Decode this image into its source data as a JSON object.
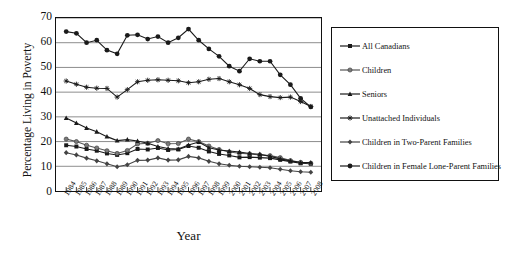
{
  "chart_data": {
    "type": "line",
    "title": "",
    "xlabel": "Year",
    "ylabel": "Percentage Living in Poverty",
    "ylim": [
      0,
      70
    ],
    "yticks": [
      0,
      10,
      20,
      30,
      40,
      50,
      60,
      70
    ],
    "grid": true,
    "legend_position": "right",
    "categories": [
      "1984",
      "1985",
      "1986",
      "1987",
      "1988",
      "1989",
      "1990",
      "1991",
      "1992",
      "1993",
      "1994",
      "1995",
      "1996",
      "1997",
      "1998",
      "1999",
      "2000",
      "2001",
      "2002",
      "2003",
      "2004",
      "2005",
      "2006",
      "2007",
      "2008"
    ],
    "series": [
      {
        "name": "All Canadians",
        "marker": "square",
        "color": "#1a1a1a",
        "values": [
          18.5,
          18.0,
          17.0,
          16.3,
          15.2,
          14.6,
          15.3,
          17.0,
          16.8,
          17.4,
          16.6,
          16.8,
          18.2,
          17.5,
          16.0,
          15.0,
          14.4,
          13.6,
          13.7,
          13.5,
          13.3,
          12.6,
          11.9,
          11.2,
          11.0
        ]
      },
      {
        "name": "Children",
        "marker": "circle-grey",
        "color": "#555555",
        "values": [
          21.0,
          20.0,
          18.5,
          17.4,
          16.3,
          15.2,
          16.4,
          19.0,
          19.3,
          20.4,
          19.1,
          19.2,
          21.0,
          20.0,
          18.2,
          16.8,
          15.8,
          15.3,
          15.0,
          14.6,
          14.3,
          13.5,
          12.3,
          11.6,
          11.2
        ]
      },
      {
        "name": "Seniors",
        "marker": "triangle",
        "color": "#1a1a1a",
        "values": [
          29.5,
          27.5,
          25.5,
          24.0,
          22.0,
          20.4,
          20.8,
          20.2,
          19.3,
          18.0,
          17.2,
          17.0,
          18.6,
          19.8,
          17.5,
          16.6,
          16.2,
          15.8,
          15.2,
          14.9,
          14.0,
          13.0,
          12.2,
          11.5,
          11.5
        ]
      },
      {
        "name": "Unattached Individuals",
        "marker": "asterisk",
        "color": "#1a1a1a",
        "values": [
          44.5,
          43.2,
          42.0,
          41.6,
          41.5,
          38.0,
          41.0,
          44.2,
          44.8,
          45.0,
          44.8,
          44.6,
          43.8,
          44.2,
          45.2,
          45.5,
          44.2,
          43.0,
          41.5,
          39.0,
          38.2,
          37.8,
          38.0,
          36.2,
          34.2
        ]
      },
      {
        "name": "Children in Two-Parent Families",
        "marker": "diamond",
        "color": "#444444",
        "values": [
          15.5,
          14.6,
          13.3,
          12.2,
          11.0,
          9.8,
          10.6,
          12.4,
          12.5,
          13.4,
          12.5,
          12.6,
          14.0,
          13.4,
          12.0,
          11.0,
          10.4,
          10.0,
          9.8,
          9.6,
          9.4,
          8.8,
          8.2,
          7.8,
          7.6
        ]
      },
      {
        "name": "Children in Female Lone-Parent Families",
        "marker": "circle-filled",
        "color": "#1a1a1a",
        "values": [
          64.5,
          63.8,
          60.0,
          61.0,
          57.0,
          55.5,
          63.0,
          63.2,
          61.5,
          62.5,
          60.0,
          62.0,
          65.5,
          61.0,
          57.5,
          54.5,
          50.5,
          48.5,
          53.5,
          52.5,
          52.5,
          47.0,
          43.0,
          37.5,
          34.0
        ]
      }
    ]
  },
  "legend": {
    "items": [
      {
        "label": "All Canadians",
        "marker": "square-marker"
      },
      {
        "label": "Children",
        "marker": "circle-grey-marker"
      },
      {
        "label": "Seniors",
        "marker": "triangle-marker"
      },
      {
        "label": "Unattached Individuals",
        "marker": "asterisk-marker"
      },
      {
        "label": "Children in Two-Parent Families",
        "marker": "diamond-marker"
      },
      {
        "label": "Children in Female Lone-Parent Families",
        "marker": "circle-filled-marker"
      }
    ]
  }
}
